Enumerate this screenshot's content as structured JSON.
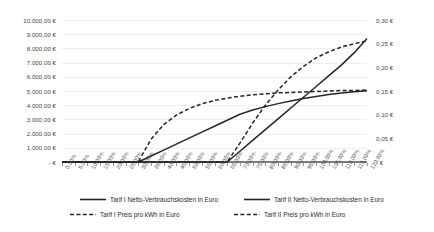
{
  "chart_data": {
    "type": "line",
    "title": "",
    "xlabel": "",
    "ylabel": "",
    "y2label": "",
    "grid": true,
    "legend_position": "bottom",
    "categories": [
      "0,00%",
      "5,00%",
      "10,00%",
      "15,00%",
      "20,00%",
      "25,00%",
      "30,00%",
      "35,00%",
      "40,00%",
      "45,00%",
      "50,00%",
      "55,00%",
      "60,00%",
      "65,00%",
      "70,00%",
      "75,00%",
      "80,00%",
      "85,00%",
      "90,00%",
      "95,00%",
      "100,00%",
      "105,00%",
      "110,00%",
      "115,00%",
      "120,00%"
    ],
    "y_axis": {
      "ticks": [
        "- €",
        "1.000,00 €",
        "2.000,00 €",
        "3.000,00 €",
        "4.000,00 €",
        "5.000,00 €",
        "6.000,00 €",
        "7.000,00 €",
        "8.000,00 €",
        "9.000,00 €",
        "10.000,00 €"
      ],
      "min": 0,
      "max": 10000,
      "step": 1000
    },
    "y2_axis": {
      "ticks": [
        "- €",
        "0,05 €",
        "0,10 €",
        "0,15 €",
        "0,20 €",
        "0,25 €",
        "0,30 €"
      ],
      "min": 0,
      "max": 0.3,
      "step": 0.05
    },
    "series": [
      {
        "name": "Tarif I Netto-Verbrauchskosten in Euro",
        "axis": "left",
        "style": "solid",
        "color": "#262626",
        "values": [
          0,
          0,
          0,
          0,
          0,
          0,
          0,
          420,
          840,
          1260,
          1680,
          2100,
          2520,
          2940,
          3360,
          3660,
          3900,
          4110,
          4300,
          4470,
          4620,
          4750,
          4860,
          4950,
          5010
        ]
      },
      {
        "name": "Tarif II Netto-Verbrauchskosten in Euro",
        "axis": "left",
        "style": "solid",
        "color": "#262626",
        "values": [
          0,
          0,
          0,
          0,
          0,
          0,
          0,
          0,
          0,
          0,
          0,
          0,
          0,
          0,
          760,
          1520,
          2280,
          3040,
          3800,
          4560,
          5320,
          6080,
          6840,
          7700,
          8700
        ]
      },
      {
        "name": "Tarif I Preis pro kWh in Euro",
        "axis": "right",
        "style": "dashed",
        "color": "#262626",
        "values": [
          0,
          0,
          0,
          0,
          0,
          0,
          0,
          0.048,
          0.079,
          0.099,
          0.113,
          0.123,
          0.13,
          0.135,
          0.139,
          0.142,
          0.144,
          0.146,
          0.147,
          0.148,
          0.149,
          0.15,
          0.151,
          0.151,
          0.152
        ]
      },
      {
        "name": "Tarif II Preis pro kWh in Euro",
        "axis": "right",
        "style": "dashed",
        "color": "#262626",
        "values": [
          0,
          0,
          0,
          0,
          0,
          0,
          0,
          0,
          0,
          0,
          0,
          0,
          0,
          0,
          0.04,
          0.082,
          0.12,
          0.152,
          0.18,
          0.202,
          0.22,
          0.233,
          0.243,
          0.25,
          0.256
        ]
      }
    ],
    "legend": [
      {
        "label": "Tarif I Netto-Verbrauchskosten in Euro",
        "style": "solid"
      },
      {
        "label": "Tarif II Netto-Verbrauchskosten in Euro",
        "style": "solid"
      },
      {
        "label": "Tarif I Preis pro kWh in Euro",
        "style": "dashed"
      },
      {
        "label": "Tarif II Preis pro kWh in Euro",
        "style": "dashed"
      }
    ],
    "colors": {
      "line": "#262626",
      "grid": "#ededed",
      "axis": "#7b7b7b",
      "text": "#4a4a4a"
    }
  }
}
